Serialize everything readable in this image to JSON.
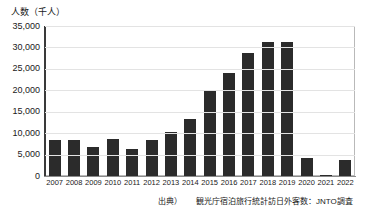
{
  "chart_data": {
    "type": "bar",
    "title": "",
    "subtitle": "",
    "ylabel": "人数（千人）",
    "xlabel": "",
    "categories": [
      "2007",
      "2008",
      "2009",
      "2010",
      "2011",
      "2012",
      "2013",
      "2014",
      "2015",
      "2016",
      "2017",
      "2018",
      "2019",
      "2020",
      "2021",
      "2022"
    ],
    "values": [
      8347,
      8351,
      6790,
      8611,
      6219,
      8358,
      10364,
      13413,
      19737,
      24039,
      28691,
      31192,
      31188,
      4116,
      245,
      3832
    ],
    "series": [
      {
        "name": "訪日外客数",
        "values": [
          8347,
          8351,
          6790,
          8611,
          6219,
          8358,
          10364,
          13413,
          19737,
          24039,
          28691,
          31192,
          31188,
          4116,
          245,
          3832
        ]
      }
    ],
    "ylim": [
      0,
      35000
    ],
    "ytick_values": [
      0,
      5000,
      10000,
      15000,
      20000,
      25000,
      30000,
      35000
    ],
    "ytick_labels": [
      "0",
      "5,000",
      "10,000",
      "15,000",
      "20,000",
      "25,000",
      "30,000",
      "35,000"
    ],
    "grid": true,
    "legend": false,
    "legend_position": "none",
    "bar_color": "#2b2b2b",
    "grid_color": "#e3e3e3",
    "axis_color": "#3a3a3a",
    "plot_border_color": "#b9b9b9"
  },
  "footnote": {
    "source_label": "出典）",
    "source_text": "観光庁宿泊旅行統計訪日外客数：JNTO調査"
  }
}
